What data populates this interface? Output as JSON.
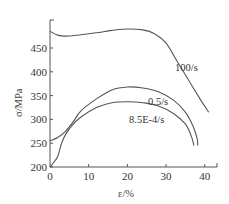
{
  "chart_data": {
    "type": "line",
    "title": "",
    "xlabel": "ε/%",
    "ylabel": "σ/MPa",
    "xlim": [
      0,
      43
    ],
    "ylim": [
      200,
      495
    ],
    "x_ticks": [
      "0",
      "10",
      "20",
      "30",
      "40"
    ],
    "y_ticks": [
      "200",
      "250",
      "300",
      "350",
      "400",
      "450"
    ],
    "grid": false,
    "legend": "inline labels",
    "series": [
      {
        "name": "100/s",
        "x": [
          0,
          2,
          4,
          8,
          12,
          16,
          20,
          24,
          27,
          30,
          33,
          36,
          39,
          41
        ],
        "values": [
          485,
          477,
          475,
          478,
          482,
          487,
          490,
          488,
          480,
          460,
          420,
          380,
          340,
          315
        ]
      },
      {
        "name": "0.5/s",
        "x": [
          0,
          2,
          4,
          6,
          8,
          12,
          16,
          20,
          24,
          28,
          32,
          35,
          37,
          38,
          38.2
        ],
        "values": [
          255,
          262,
          275,
          295,
          318,
          343,
          362,
          368,
          366,
          358,
          340,
          315,
          285,
          260,
          245
        ]
      },
      {
        "name": "8.5E-4/s",
        "x": [
          0,
          1,
          2,
          3,
          4,
          6,
          8,
          12,
          16,
          20,
          24,
          28,
          32,
          35,
          36.5,
          37.2
        ],
        "values": [
          200,
          210,
          222,
          250,
          268,
          290,
          305,
          325,
          335,
          337,
          335,
          328,
          312,
          290,
          265,
          245
        ]
      }
    ]
  }
}
